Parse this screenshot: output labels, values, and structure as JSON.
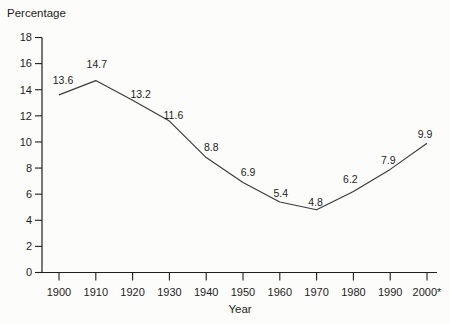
{
  "chart_data": {
    "type": "line",
    "title": "",
    "ylabel": "Percentage",
    "xlabel": "Year",
    "categories": [
      "1900",
      "1910",
      "1920",
      "1930",
      "1940",
      "1950",
      "1960",
      "1970",
      "1980",
      "1990",
      "2000*"
    ],
    "values": [
      13.6,
      14.7,
      13.2,
      11.6,
      8.8,
      6.9,
      5.4,
      4.8,
      6.2,
      7.9,
      9.9
    ],
    "data_labels": [
      "13.6",
      "14.7",
      "13.2",
      "11.6",
      "8.8",
      "6.9",
      "5.4",
      "4.8",
      "6.2",
      "7.9",
      "9.9"
    ],
    "y_ticks": [
      0,
      2,
      4,
      6,
      8,
      10,
      12,
      14,
      16,
      18
    ],
    "ylim": [
      0,
      18
    ],
    "grid": false,
    "legend": "none",
    "line_color": "#3a3a3a",
    "axis_color": "#1f1f1f",
    "text_color": "#1c1c1c",
    "label_offsets": [
      [
        4,
        -14
      ],
      [
        1,
        -16
      ],
      [
        8,
        -6
      ],
      [
        4,
        -6
      ],
      [
        5,
        -10
      ],
      [
        5,
        -10
      ],
      [
        1,
        -9
      ],
      [
        -1,
        -7
      ],
      [
        -3,
        -12
      ],
      [
        -2,
        -9
      ],
      [
        -2,
        -9
      ]
    ]
  }
}
